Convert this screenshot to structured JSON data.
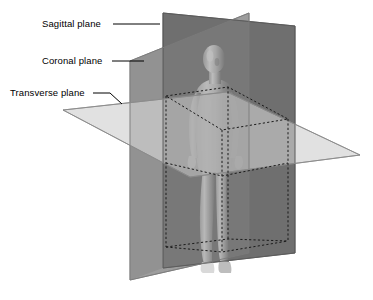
{
  "figure": {
    "background_color": "#ffffff"
  },
  "labels": [
    {
      "id": "sagittal",
      "text": "Sagittal plane",
      "x": 42,
      "y": 19,
      "leader": {
        "x1": 113,
        "y1": 24,
        "x2": 160,
        "y2": 24
      }
    },
    {
      "id": "coronal",
      "text": "Coronal plane",
      "x": 42,
      "y": 56,
      "leader": {
        "x1": 112,
        "y1": 61,
        "x2": 144,
        "y2": 61
      }
    },
    {
      "id": "transverse",
      "text": "Transverse plane",
      "x": 10,
      "y": 88,
      "leader": {
        "x1": 93,
        "y1": 93,
        "x2": 122,
        "y2": 104
      }
    }
  ],
  "planes": [
    {
      "id": "sagittal",
      "name": "Sagittal plane",
      "orientation": "vertical-front-to-back",
      "color": "#6e6e6e",
      "opacity": 0.95,
      "points": "163,13 295,26 295,253 163,268"
    },
    {
      "id": "coronal",
      "name": "Coronal plane",
      "orientation": "vertical-left-to-right",
      "color": "#9a9a9a",
      "opacity": 0.92,
      "points": "130,61 249,13 249,253 130,280"
    },
    {
      "id": "transverse",
      "name": "Transverse plane",
      "orientation": "horizontal",
      "color": "#d8d8d8",
      "opacity": 0.85,
      "points": "63,110 227,92 360,155 190,177"
    }
  ],
  "bounding_box": {
    "name": "dashed-reference-box",
    "style": "dashed",
    "color": "#1a1a1a"
  },
  "colors": {
    "sagittal_plane": "#6e6e6e",
    "coronal_plane": "#9a9a9a",
    "transverse_plane": "#d8d8d8",
    "label_text": "#000000",
    "leader_line": "#000000",
    "background": "#ffffff"
  }
}
